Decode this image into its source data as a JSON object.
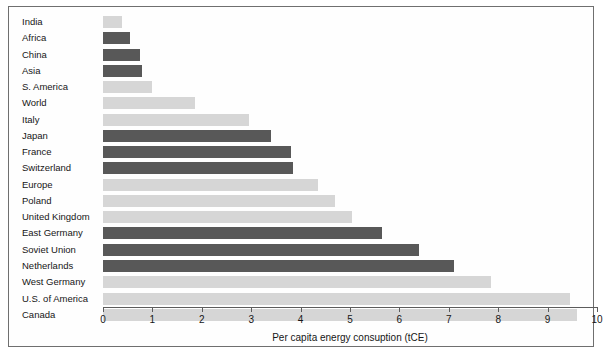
{
  "chart_data": {
    "type": "bar",
    "orientation": "horizontal",
    "title": "",
    "xlabel": "Per capita energy consuption (tCE)",
    "ylabel": "",
    "xlim": [
      0,
      10
    ],
    "xticks": [
      "0",
      "1",
      "2",
      "3",
      "4",
      "5",
      "6",
      "7",
      "8",
      "9",
      "10"
    ],
    "grid": false,
    "legend": "none",
    "categories": [
      "India",
      "Africa",
      "China",
      "Asia",
      "S. America",
      "World",
      "Italy",
      "Japan",
      "France",
      "Switzerland",
      "Europe",
      "Poland",
      "United Kingdom",
      "East Germany",
      "Soviet Union",
      "Netherlands",
      "West Germany",
      "U.S. of America",
      "Canada"
    ],
    "values": [
      0.38,
      0.55,
      0.75,
      0.79,
      1.0,
      1.86,
      2.95,
      3.4,
      3.8,
      3.85,
      4.35,
      4.7,
      5.05,
      5.65,
      6.4,
      7.1,
      7.85,
      9.45,
      9.6
    ],
    "bar_shades": [
      "light",
      "dark",
      "dark",
      "dark",
      "light",
      "light",
      "light",
      "dark",
      "dark",
      "dark",
      "light",
      "light",
      "light",
      "dark",
      "dark",
      "dark",
      "light",
      "light",
      "light"
    ],
    "colors": {
      "light_bar": "#d6d6d6",
      "dark_bar": "#585858",
      "axis": "#5c5c5c",
      "frame": "#6f6f6f",
      "text": "#161616",
      "background": "#ffffff"
    }
  }
}
